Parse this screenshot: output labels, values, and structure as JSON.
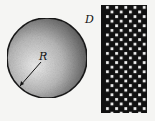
{
  "diagram": {
    "sphere": {
      "label": "R",
      "cx": 47,
      "cy": 58,
      "r": 40
    },
    "plate": {
      "label": "D",
      "x": 101,
      "y": 5,
      "width": 46,
      "height": 108,
      "cell": 4.6
    },
    "colors": {
      "background": "#f5f5f3",
      "ink": "#111111",
      "shade_dark": "#3a3a3a",
      "shade_light": "#e8e8e8"
    }
  }
}
